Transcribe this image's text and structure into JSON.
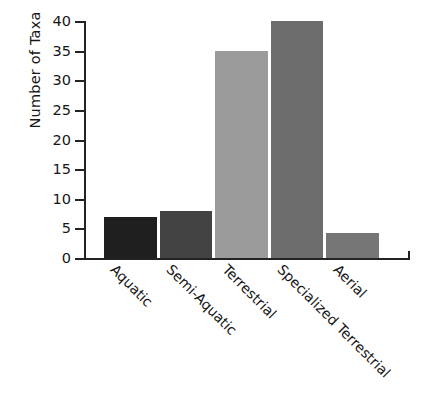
{
  "chart_data": {
    "type": "bar",
    "title": "",
    "xlabel": "",
    "ylabel": "Number of Taxa",
    "categories": [
      "Aquatic",
      "Semi-Aquatic",
      "Terrestrial",
      "Specialized Terrestrial",
      "Aerial"
    ],
    "values": [
      7,
      8,
      35,
      40,
      4.3
    ],
    "ylim": [
      0,
      40
    ],
    "yticks": [
      0,
      5,
      10,
      15,
      20,
      25,
      30,
      35,
      40
    ],
    "ytick_labels": [
      "0",
      "5",
      "10",
      "15",
      "20",
      "25",
      "30",
      "35",
      "40"
    ],
    "grid": false,
    "legend": "none",
    "bar_colors": [
      "#1f1f1f",
      "#434343",
      "#9b9b9b",
      "#6d6d6d",
      "#767676"
    ],
    "axis_color": "#232323"
  }
}
